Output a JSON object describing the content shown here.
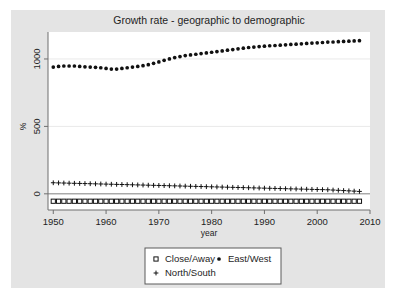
{
  "chart_data": {
    "type": "scatter",
    "title": "Growth rate - geographic to demographic",
    "xlabel": "year",
    "ylabel": "%",
    "xlim": [
      1949,
      2010
    ],
    "ylim": [
      -120,
      1200
    ],
    "xticks": [
      1950,
      1960,
      1970,
      1980,
      1990,
      2000,
      2010
    ],
    "xtick_labels": [
      "1950",
      "1960",
      "1970",
      "1980",
      "1990",
      "2000",
      "2010"
    ],
    "yticks": [
      0,
      500,
      1000
    ],
    "ytick_labels": [
      "0",
      "500",
      "1000"
    ],
    "grid": true,
    "legend_position": "bottom",
    "x": [
      1950,
      1951,
      1952,
      1953,
      1954,
      1955,
      1956,
      1957,
      1958,
      1959,
      1960,
      1961,
      1962,
      1963,
      1964,
      1965,
      1966,
      1967,
      1968,
      1969,
      1970,
      1971,
      1972,
      1973,
      1974,
      1975,
      1976,
      1977,
      1978,
      1979,
      1980,
      1981,
      1982,
      1983,
      1984,
      1985,
      1986,
      1987,
      1988,
      1989,
      1990,
      1991,
      1992,
      1993,
      1994,
      1995,
      1996,
      1997,
      1998,
      1999,
      2000,
      2001,
      2002,
      2003,
      2004,
      2005,
      2006,
      2007,
      2008
    ],
    "series": [
      {
        "name": "Close/Away",
        "marker": "square-open",
        "color": "#111111",
        "values": [
          -55,
          -55,
          -55,
          -55,
          -55,
          -55,
          -55,
          -55,
          -55,
          -55,
          -55,
          -55,
          -55,
          -55,
          -55,
          -55,
          -55,
          -55,
          -55,
          -55,
          -55,
          -55,
          -55,
          -55,
          -55,
          -55,
          -55,
          -55,
          -55,
          -55,
          -55,
          -55,
          -55,
          -55,
          -55,
          -55,
          -55,
          -55,
          -55,
          -55,
          -55,
          -55,
          -55,
          -55,
          -55,
          -55,
          -55,
          -55,
          -55,
          -55,
          -55,
          -55,
          -55,
          -55,
          -55,
          -55,
          -55,
          -55,
          -55
        ]
      },
      {
        "name": "East/West",
        "marker": "circle-filled",
        "color": "#111111",
        "values": [
          940,
          945,
          948,
          948,
          948,
          945,
          942,
          940,
          938,
          935,
          930,
          925,
          925,
          930,
          935,
          940,
          945,
          950,
          958,
          968,
          978,
          990,
          1000,
          1010,
          1018,
          1025,
          1030,
          1035,
          1040,
          1045,
          1050,
          1055,
          1060,
          1065,
          1070,
          1075,
          1080,
          1085,
          1088,
          1092,
          1095,
          1098,
          1100,
          1102,
          1105,
          1108,
          1110,
          1112,
          1115,
          1118,
          1120,
          1122,
          1125,
          1126,
          1128,
          1130,
          1132,
          1134,
          1136
        ]
      },
      {
        "name": "North/South",
        "marker": "plus",
        "color": "#111111",
        "values": [
          82,
          81,
          80,
          79,
          78,
          77,
          76,
          75,
          74,
          73,
          72,
          71,
          70,
          69,
          68,
          67,
          66,
          65,
          64,
          63,
          62,
          61,
          60,
          59,
          58,
          57,
          56,
          55,
          54,
          53,
          52,
          51,
          50,
          49,
          48,
          47,
          46,
          45,
          44,
          43,
          42,
          41,
          40,
          39,
          38,
          37,
          36,
          35,
          34,
          33,
          32,
          31,
          30,
          28,
          26,
          24,
          22,
          20,
          18
        ]
      }
    ]
  },
  "legend": {
    "entries": [
      {
        "label": "Close/Away",
        "marker": "square-open"
      },
      {
        "label": "East/West",
        "marker": "circle-filled"
      },
      {
        "label": "North/South",
        "marker": "plus"
      }
    ]
  }
}
